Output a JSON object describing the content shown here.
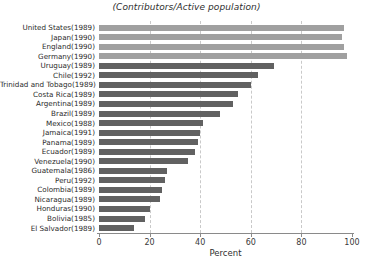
{
  "chart_data": {
    "type": "bar",
    "orientation": "horizontal",
    "title": "(Contributors/Active population)",
    "xlabel": "Percent",
    "ylabel": "",
    "xlim": [
      0,
      100
    ],
    "xticks": [
      0,
      20,
      40,
      60,
      80,
      100
    ],
    "grid": "vertical-dashed",
    "legend": "none",
    "colors": {
      "light_bar": "#a0a0a0",
      "dark_bar": "#616161",
      "axis": "#8a8a8a",
      "gridline": "#c9c9c9",
      "text": "#2b2b2b"
    },
    "categories": [
      "United States(1989)",
      "Japan(1990)",
      "England(1990)",
      "Germany(1990)",
      "Uruguay(1989)",
      "Chile(1992)",
      "Trinidad and Tobago(1989)",
      "Costa Rica(1989)",
      "Argentina(1989)",
      "Brazil(1989)",
      "Mexico(1988)",
      "Jamaica(1991)",
      "Panama(1989)",
      "Ecuador(1989)",
      "Venezuela(1990)",
      "Guatemala(1986)",
      "Peru(1992)",
      "Colombia(1989)",
      "Nicaragua(1989)",
      "Honduras(1990)",
      "Bolivia(1985)",
      "El Salvador(1989)"
    ],
    "values": [
      97,
      96,
      97,
      98,
      69,
      63,
      60,
      55,
      53,
      48,
      41,
      40,
      39,
      38,
      35,
      27,
      26,
      25,
      24,
      20,
      18,
      14
    ],
    "series_group": [
      "light",
      "light",
      "light",
      "light",
      "dark",
      "dark",
      "dark",
      "dark",
      "dark",
      "dark",
      "dark",
      "dark",
      "dark",
      "dark",
      "dark",
      "dark",
      "dark",
      "dark",
      "dark",
      "dark",
      "dark",
      "dark"
    ]
  }
}
